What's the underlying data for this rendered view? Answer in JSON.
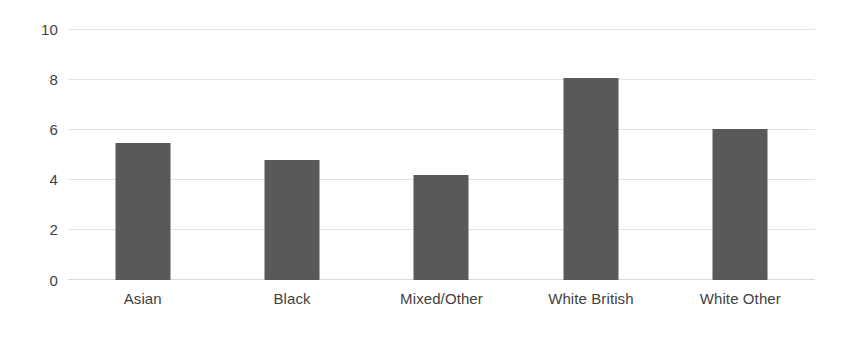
{
  "chart_data": {
    "type": "bar",
    "title": "",
    "subtitle": "",
    "xlabel": "",
    "ylabel": "",
    "categories": [
      "Asian",
      "Black",
      "Mixed/Other",
      "White British",
      "White Other"
    ],
    "values": [
      5.5,
      4.8,
      4.2,
      8.1,
      6.05
    ],
    "ylim": [
      0,
      10
    ],
    "ytick_labels": [
      "10",
      "8",
      "6",
      "4",
      "2",
      "0"
    ],
    "ytick_values": [
      10,
      8,
      6,
      4,
      2,
      0
    ],
    "grid": true,
    "grid_axis": "y",
    "legend": false,
    "legend_position": "none",
    "series": [
      {
        "name": "",
        "values": [
          5.5,
          4.8,
          4.2,
          8.1,
          6.05
        ]
      }
    ],
    "annotations": []
  },
  "style": {
    "bar_color": "#595959",
    "gridline_color": "#e2e2e2",
    "baseline_color": "#d9d9d9",
    "text_color": "#3f3f3f",
    "background_color": "#ffffff"
  }
}
